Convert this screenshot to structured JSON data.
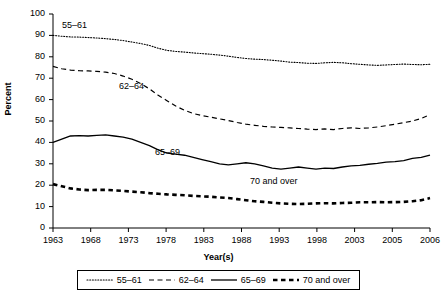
{
  "chart_data": {
    "type": "line",
    "title": "",
    "xlabel": "Year(s)",
    "ylabel": "Percent",
    "ylim": [
      0,
      100
    ],
    "ytick_values": [
      0,
      10,
      20,
      30,
      40,
      50,
      60,
      70,
      80,
      90,
      100
    ],
    "xtick_labels": [
      "1963",
      "1968",
      "1973",
      "1978",
      "1983",
      "1988",
      "1993",
      "1998",
      "2003",
      "2005",
      "2006"
    ],
    "x_years_full": [
      1963,
      1964,
      1965,
      1966,
      1967,
      1968,
      1969,
      1970,
      1971,
      1972,
      1973,
      1974,
      1975,
      1976,
      1977,
      1978,
      1979,
      1980,
      1981,
      1982,
      1983,
      1984,
      1985,
      1986,
      1987,
      1988,
      1989,
      1990,
      1991,
      1992,
      1993,
      1994,
      1995,
      1996,
      1997,
      1998,
      1999,
      2000,
      2001,
      2002,
      2003,
      2004,
      2005,
      2006
    ],
    "grid": false,
    "legend_position": "bottom",
    "series": [
      {
        "name": "55–61",
        "style": "dotted",
        "label_annotation": "55–61",
        "values": [
          90.0,
          89.6,
          89.3,
          89.2,
          89.0,
          88.8,
          88.5,
          88.1,
          87.6,
          86.9,
          86.2,
          85.3,
          84.0,
          83.0,
          82.5,
          82.2,
          81.8,
          81.5,
          81.2,
          80.8,
          80.3,
          79.7,
          79.2,
          78.9,
          78.7,
          78.4,
          78.0,
          77.5,
          77.3,
          77.0,
          76.9,
          77.2,
          77.4,
          77.2,
          76.8,
          76.5,
          76.2,
          76.0,
          76.2,
          76.4,
          76.6,
          76.4,
          76.3,
          76.5
        ]
      },
      {
        "name": "62–64",
        "style": "dashed",
        "label_annotation": "62–64",
        "values": [
          75.5,
          74.4,
          73.8,
          73.5,
          73.4,
          73.2,
          72.8,
          72.2,
          71.0,
          69.5,
          67.5,
          65.0,
          62.0,
          59.5,
          57.0,
          55.0,
          53.5,
          52.5,
          51.8,
          51.0,
          50.2,
          49.3,
          48.5,
          48.0,
          47.5,
          47.2,
          47.0,
          46.8,
          46.5,
          46.2,
          46.0,
          46.3,
          46.0,
          46.5,
          46.8,
          46.5,
          46.8,
          47.2,
          47.8,
          48.5,
          49.2,
          50.0,
          51.2,
          53.0
        ]
      },
      {
        "name": "65–69",
        "style": "solid",
        "label_annotation": "65–69",
        "values": [
          40.0,
          41.5,
          43.0,
          43.2,
          43.0,
          43.3,
          43.5,
          43.0,
          42.5,
          41.5,
          40.0,
          38.5,
          36.5,
          35.0,
          34.5,
          34.0,
          33.0,
          32.0,
          31.0,
          30.0,
          29.5,
          30.0,
          30.5,
          30.0,
          29.0,
          28.0,
          27.5,
          28.0,
          28.5,
          28.0,
          27.5,
          28.0,
          27.8,
          28.5,
          29.0,
          29.3,
          29.8,
          30.2,
          30.8,
          31.0,
          31.5,
          32.5,
          33.0,
          34.0
        ]
      },
      {
        "name": "70 and over",
        "style": "thick-dashed",
        "label_annotation": "70 and over",
        "values": [
          20.5,
          19.5,
          18.5,
          18.0,
          17.7,
          17.8,
          17.8,
          17.6,
          17.3,
          17.0,
          16.7,
          16.3,
          16.0,
          15.7,
          15.5,
          15.3,
          15.0,
          14.8,
          14.6,
          14.3,
          14.0,
          13.5,
          13.0,
          12.5,
          12.2,
          11.8,
          11.5,
          11.3,
          11.2,
          11.3,
          11.5,
          11.6,
          11.5,
          11.7,
          11.8,
          12.0,
          12.0,
          12.1,
          12.0,
          12.1,
          12.2,
          12.5,
          13.0,
          14.0
        ]
      }
    ]
  },
  "annotations": [
    {
      "text": "55–61",
      "x": 62,
      "y": 26
    },
    {
      "text": "62–64",
      "x": 119,
      "y": 86
    },
    {
      "text": "65–69",
      "x": 155,
      "y": 152
    },
    {
      "text": "70 and over",
      "x": 250,
      "y": 181
    }
  ],
  "legend": {
    "items": [
      {
        "label": "55–61",
        "style": "dotted"
      },
      {
        "label": "62–64",
        "style": "dashed"
      },
      {
        "label": "65–69",
        "style": "solid"
      },
      {
        "label": "70 and over",
        "style": "thick-dashed"
      }
    ]
  },
  "colors": {
    "line": "#000000",
    "axis": "#000000",
    "background": "#ffffff"
  }
}
